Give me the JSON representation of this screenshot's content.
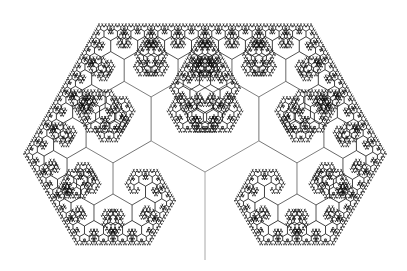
{
  "figure": {
    "type": "fractal-binary-tree",
    "background": "#ffffff",
    "width": 407,
    "height": 271,
    "trunk": {
      "x": 205,
      "y_base": 260,
      "length": 88,
      "angle_deg": 90
    },
    "branch_angle_deg": 60,
    "scale_ratio": 0.707,
    "depth": 13,
    "stroke_width": 0.8,
    "color_light": "#a8a8a8",
    "color_dark": "#111111"
  }
}
